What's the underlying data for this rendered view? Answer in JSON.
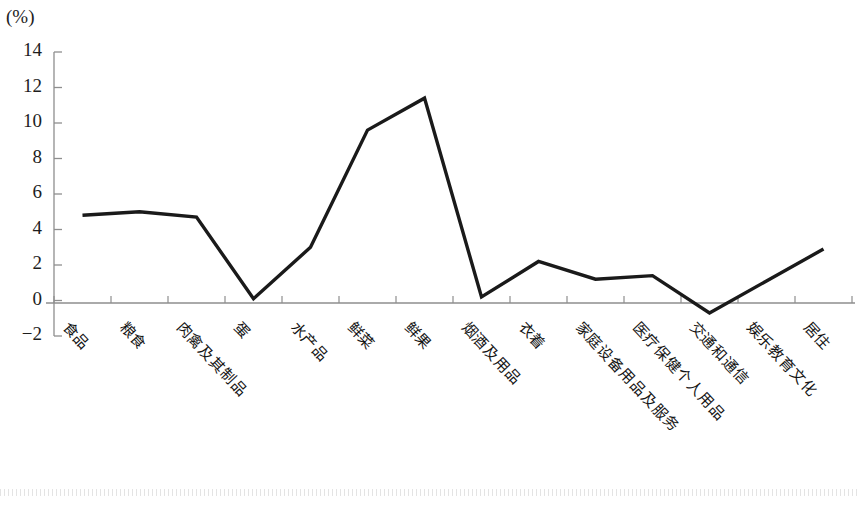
{
  "axis": {
    "unit_label": "(%)",
    "y_ticks": [
      "14",
      "12",
      "10",
      "8",
      "6",
      "4",
      "2",
      "0",
      "−2"
    ]
  },
  "chart_data": {
    "type": "line",
    "title": "",
    "subtitle": "",
    "xlabel": "",
    "ylabel": "(%)",
    "ylim": [
      -2,
      14
    ],
    "ytick_values": [
      -2,
      0,
      2,
      4,
      6,
      8,
      10,
      12,
      14
    ],
    "grid": false,
    "legend": "none",
    "line_color": "#1a1a1a",
    "categories": [
      "食品",
      "粮食",
      "肉禽及其制品",
      "蛋",
      "水产品",
      "鲜菜",
      "鲜果",
      "烟酒及用品",
      "衣着",
      "家庭设备用品及服务",
      "医疗保健个人用品",
      "交通和通信",
      "娱乐教育文化",
      "居住"
    ],
    "values": [
      4.8,
      5.0,
      4.7,
      0.1,
      3.0,
      9.6,
      11.4,
      0.2,
      2.2,
      1.2,
      1.4,
      -0.7,
      1.1,
      2.9
    ]
  }
}
